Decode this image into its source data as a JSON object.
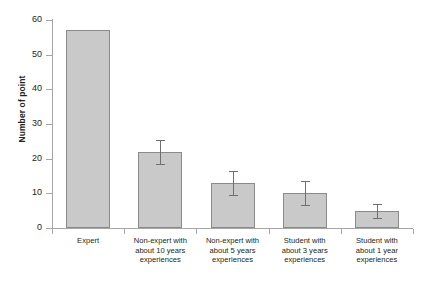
{
  "chart_data": {
    "type": "bar",
    "title": "",
    "xlabel": "",
    "ylabel": "Number of point",
    "ylim": [
      0,
      60
    ],
    "yticks": [
      0,
      10,
      20,
      30,
      40,
      50,
      60
    ],
    "grid": false,
    "legend": null,
    "categories": [
      "Expert",
      "Non-expert with about 10 years experiences",
      "Non-expert with about 5 years experiences",
      "Student with about 3 years experiences",
      "Student with about 1 year experiences"
    ],
    "category_lines": [
      [
        "Expert"
      ],
      [
        "Non-expert with",
        "about 10 years",
        "experiences"
      ],
      [
        "Non-expert with",
        "about 5 years",
        "experiences"
      ],
      [
        "Student with",
        "about 3 years",
        "experiences"
      ],
      [
        "Student with",
        "about 1 year",
        "experiences"
      ]
    ],
    "values": [
      57,
      22,
      13,
      10,
      5
    ],
    "errors": [
      0,
      3.5,
      3.5,
      3.5,
      2.0
    ],
    "bar_fill": "#c9c9c9",
    "bar_border": "#8a8a8a",
    "error_color": "#6f6f6f",
    "axis_color": "#a6a6a6"
  }
}
